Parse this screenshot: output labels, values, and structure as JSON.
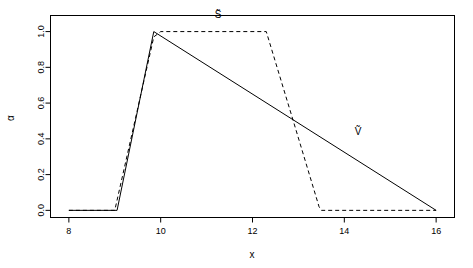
{
  "chart_data": {
    "type": "line",
    "title": "",
    "xlabel": "x",
    "ylabel": "α",
    "xlim": [
      7.6,
      16.4
    ],
    "ylim": [
      -0.04,
      1.09
    ],
    "xticks": [
      8,
      10,
      12,
      14,
      16
    ],
    "xtick_labels": [
      "8",
      "10",
      "12",
      "14",
      "16"
    ],
    "yticks": [
      0.0,
      0.2,
      0.4,
      0.6,
      0.8,
      1.0
    ],
    "ytick_labels": [
      "0.0",
      "0.2",
      "0.4",
      "0.6",
      "0.8",
      "1.0"
    ],
    "grid": false,
    "legend_position": "inline-annotations",
    "series": [
      {
        "name": "S̃",
        "label": "S̃",
        "style": "dashed",
        "color": "#000000",
        "annotation": {
          "text": "S̃",
          "x": 11.25,
          "y": 1.075
        },
        "x": [
          8.0,
          9.0,
          9.85,
          10.0,
          12.3,
          12.9,
          13.45,
          13.5,
          16.0
        ],
        "y": [
          0.0,
          0.0,
          0.97,
          1.0,
          1.0,
          0.49,
          0.02,
          0.0,
          0.0
        ]
      },
      {
        "name": "Ṽ",
        "label": "Ṽ",
        "style": "solid",
        "color": "#000000",
        "annotation": {
          "text": "Ṽ",
          "x": 14.3,
          "y": 0.42
        },
        "x": [
          8.0,
          9.05,
          9.85,
          16.0
        ],
        "y": [
          0.0,
          0.0,
          1.0,
          0.0
        ]
      }
    ]
  }
}
